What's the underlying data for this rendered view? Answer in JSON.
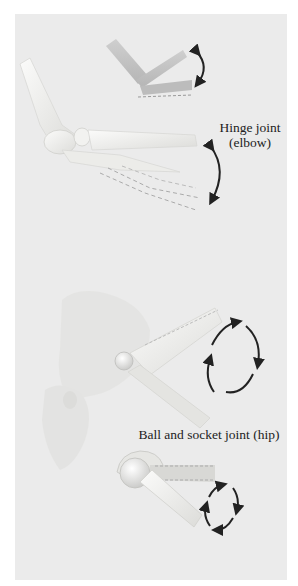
{
  "figure": {
    "sections": [
      {
        "id": "hinge",
        "label_line1": "Hinge joint",
        "label_line2": "(elbow)",
        "motion": "flexion-extension in one plane",
        "icon": "double-headed-arc-arrow"
      },
      {
        "id": "ball-socket",
        "label": "Ball and socket joint (hip)",
        "motion": "rotation in multiple planes",
        "icon": "circular-arrows"
      }
    ]
  },
  "colors": {
    "background": "#ebebeb",
    "page": "#ffffff",
    "bone_light": "#f7f7f5",
    "bone_shadow": "#d2d2cf",
    "model_gray": "#c4c4c4",
    "arrow": "#222222",
    "text": "#222222"
  }
}
